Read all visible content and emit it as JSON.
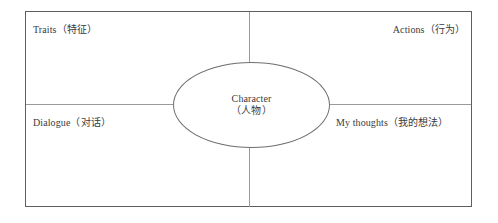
{
  "diagram": {
    "type": "character-graphic-organizer",
    "center": {
      "title_en": "Character",
      "title_zh": "（人物）"
    },
    "quadrants": [
      {
        "id": "traits",
        "label": "Traits（特征）",
        "position": "top-left"
      },
      {
        "id": "actions",
        "label": "Actions（行为）",
        "position": "top-right"
      },
      {
        "id": "dialogue",
        "label": "Dialogue（对话）",
        "position": "bottom-left"
      },
      {
        "id": "my-thoughts",
        "label": "My thoughts（我的想法）",
        "position": "bottom-right"
      }
    ],
    "colors": {
      "frame_border": "#5e5e62",
      "divider": "#9a9a9e",
      "ellipse_border": "#6f6f74",
      "text": "#3a3a3d",
      "background": "#ffffff"
    }
  }
}
